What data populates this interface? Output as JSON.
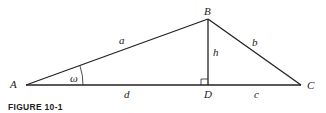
{
  "figure": {
    "caption": "FIGURE 10-1",
    "vertices": {
      "A": "A",
      "B": "B",
      "C": "C",
      "D": "D"
    },
    "sides": {
      "a": "a",
      "b": "b",
      "h": "h",
      "d": "d",
      "c": "c"
    },
    "angle": "ω"
  }
}
